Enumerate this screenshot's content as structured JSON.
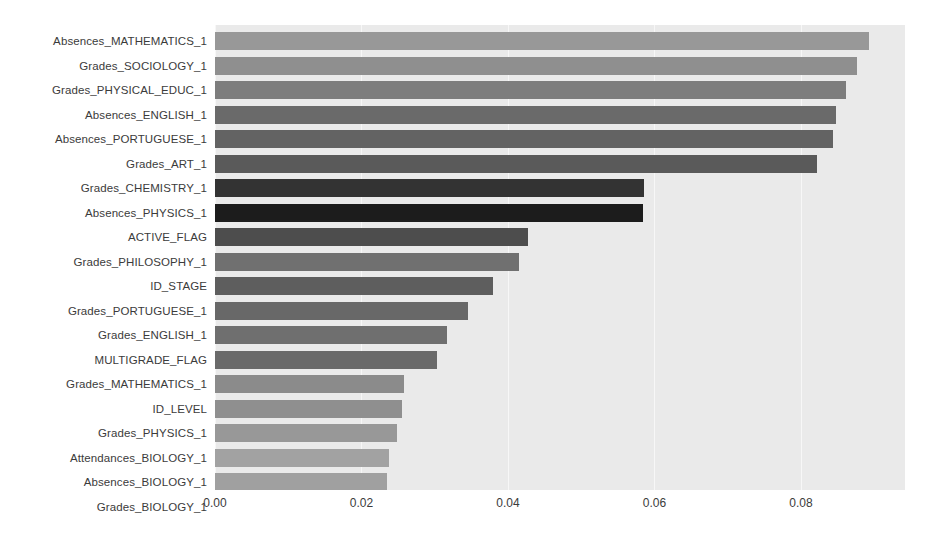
{
  "chart_data": {
    "type": "bar",
    "orientation": "horizontal",
    "title": "",
    "xlabel": "",
    "ylabel": "",
    "xlim": [
      0.0,
      0.0942
    ],
    "xticks": [
      0.0,
      0.02,
      0.04,
      0.06,
      0.08
    ],
    "xtick_labels": [
      "0.00",
      "0.02",
      "0.04",
      "0.06",
      "0.08"
    ],
    "grid": true,
    "grid_axis": "x",
    "legend": "none",
    "plot_background": "#eaeaea",
    "figure_background": "#ffffff",
    "categories": [
      "Absences_MATHEMATICS_1",
      "Grades_SOCIOLOGY_1",
      "Grades_PHYSICAL_EDUC_1",
      "Absences_ENGLISH_1",
      "Absences_PORTUGUESE_1",
      "Grades_ART_1",
      "Grades_CHEMISTRY_1",
      "Absences_PHYSICS_1",
      "ACTIVE_FLAG",
      "Grades_PHILOSOPHY_1",
      "ID_STAGE",
      "Grades_PORTUGUESE_1",
      "Grades_ENGLISH_1",
      "MULTIGRADE_FLAG",
      "Grades_MATHEMATICS_1",
      "ID_LEVEL",
      "Grades_PHYSICS_1",
      "Attendances_BIOLOGY_1",
      "Absences_BIOLOGY_1",
      "Grades_BIOLOGY_1"
    ],
    "values": [
      0.0893,
      0.0876,
      0.0861,
      0.0848,
      0.0844,
      0.0822,
      0.0586,
      0.0584,
      0.0427,
      0.0415,
      0.038,
      0.0346,
      0.0317,
      0.0303,
      0.0258,
      0.0255,
      0.0248,
      0.0238,
      0.0235,
      0.0216
    ],
    "bar_colors": [
      "#989898",
      "#8f8f8f",
      "#7d7d7d",
      "#6a6a6a",
      "#636363",
      "#5a5a5a",
      "#333333",
      "#1c1c1c",
      "#4d4d4d",
      "#707070",
      "#5e5e5e",
      "#686868",
      "#6f6f6f",
      "#6a6a6a",
      "#8b8b8b",
      "#8f8f8f",
      "#989898",
      "#a2a2a2",
      "#a0a0a0",
      "#a5a5a5"
    ]
  }
}
